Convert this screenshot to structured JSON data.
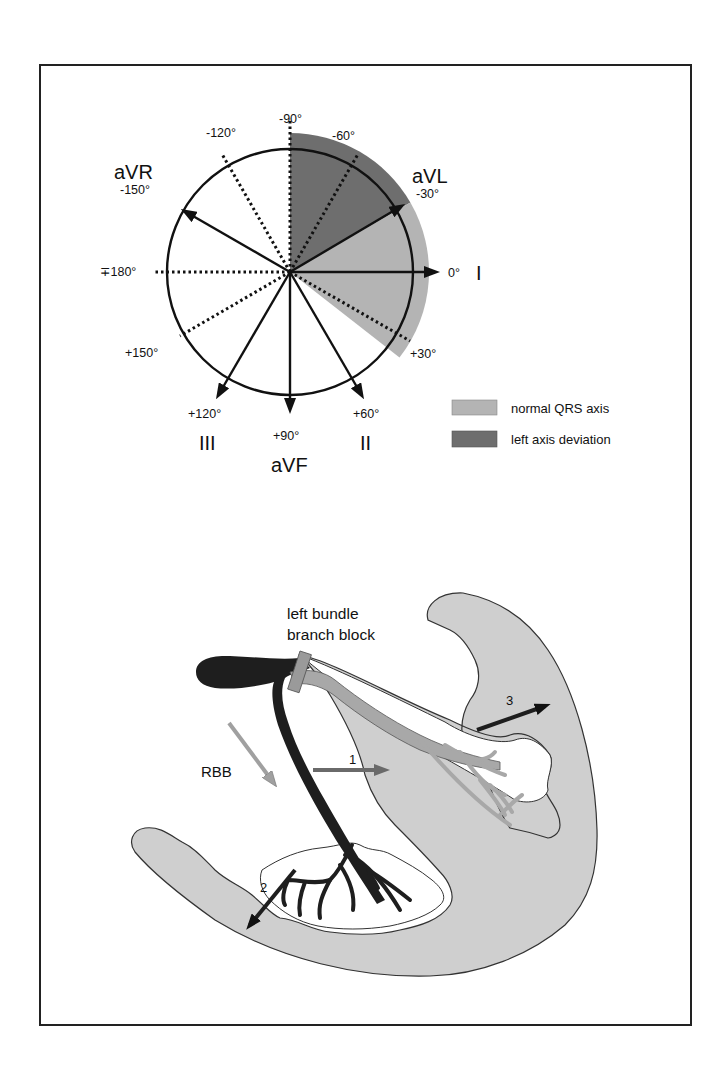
{
  "figure": {
    "top_panel": {
      "title": "Hexaxial reference system",
      "lead_labels": {
        "aVR": "aVR",
        "aVL": "aVL",
        "I": "I",
        "II": "II",
        "III": "III",
        "aVF": "aVF"
      },
      "angle_labels": {
        "m90": "-90°",
        "m120": "-120°",
        "m60": "-60°",
        "m150": "-150°",
        "m30": "-30°",
        "p180": "∓180°",
        "zero": "0°",
        "p30": "+30°",
        "p150": "+150°",
        "p120": "+120°",
        "p90": "+90°",
        "p60": "+60°"
      },
      "legend": [
        {
          "label": "normal QRS axis",
          "color": "#b4b4b4"
        },
        {
          "label": "left axis deviation",
          "color": "#6e6e6e"
        }
      ]
    },
    "bottom_panel": {
      "block_label_line1": "left bundle",
      "block_label_line2": "branch block",
      "rbb_label": "RBB",
      "arrow_labels": [
        "1",
        "2",
        "3"
      ]
    },
    "colors": {
      "normal_axis": "#b4b4b4",
      "left_axis_deviation": "#6e6e6e",
      "myocardium": "#cfcfcf",
      "conduction_dark": "#1e1e1e",
      "blocked_branch": "#a8a8a8",
      "block_marker": "#9a9a9a",
      "rbb_arrow": "#a0a0a0",
      "arrow1": "#6a6a6a"
    }
  }
}
